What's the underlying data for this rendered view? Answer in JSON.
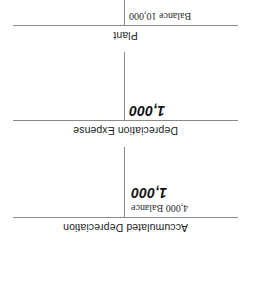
{
  "figure": {
    "kind": "t-account-diagram",
    "orientation_degrees": 180,
    "line_color": "#8a8a8a",
    "text_color": "#222222"
  },
  "accounts": [
    {
      "title": "Plant",
      "debit_entries": [
        {
          "text": "Balance 10,000",
          "style": "serif"
        }
      ],
      "credit_entries": []
    },
    {
      "title": "Depreciation Expense",
      "debit_entries": [
        {
          "text": "1,000",
          "style": "entry"
        }
      ],
      "credit_entries": []
    },
    {
      "title": "Accumulated Depreciation",
      "debit_entries": [],
      "credit_entries": [
        {
          "text": "4,000 Balance",
          "style": "serif"
        },
        {
          "text": "1,000",
          "style": "entry"
        }
      ]
    }
  ]
}
